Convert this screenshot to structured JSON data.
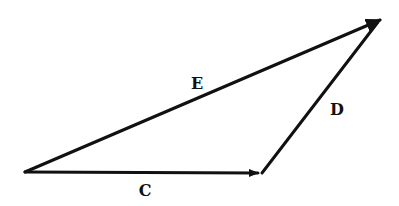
{
  "diagram": {
    "type": "vector-addition-triangle",
    "vectors": [
      {
        "id": "C",
        "label": "C",
        "from": [
          25,
          172
        ],
        "to": [
          258,
          173
        ],
        "label_pos": [
          145,
          196
        ]
      },
      {
        "id": "D",
        "label": "D",
        "from": [
          262,
          173
        ],
        "to": [
          378,
          22
        ],
        "label_pos": [
          337,
          115
        ]
      },
      {
        "id": "E",
        "label": "E",
        "from": [
          25,
          172
        ],
        "to": [
          380,
          20
        ],
        "label_pos": [
          197,
          89
        ]
      }
    ],
    "relationship": "C + D = E",
    "colors": {
      "stroke": "#111111",
      "background": "#ffffff"
    }
  }
}
